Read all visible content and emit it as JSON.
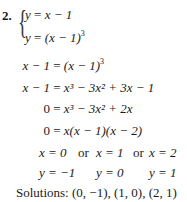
{
  "problem": {
    "number": "2.",
    "system": [
      {
        "lhs": "y",
        "rhs_pre": "x − 1",
        "rhs_sup": ""
      },
      {
        "lhs": "y",
        "rhs_pre": "(x − 1)",
        "rhs_sup": "3"
      }
    ]
  },
  "steps": [
    {
      "lhs": "x − 1",
      "rhs": "(x − 1)",
      "sup": "3"
    },
    {
      "lhs": "x − 1",
      "rhs": "x³ − 3x² + 3x − 1"
    },
    {
      "lhs": "0",
      "rhs": "x³ − 3x² + 2x"
    },
    {
      "lhs": "0",
      "rhs": "x(x − 1)(x − 2)"
    }
  ],
  "x_values": [
    "x = 0",
    "or",
    "x = 1",
    "or",
    "x = 2"
  ],
  "y_values": [
    "y = −1",
    "y = 0",
    "y = 1"
  ],
  "solutions": {
    "label": "Solutions:",
    "value": "(0, −1), (1, 0), (2, 1)"
  }
}
